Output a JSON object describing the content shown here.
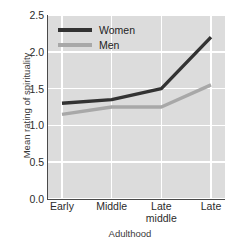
{
  "chart_data": {
    "type": "line",
    "title": "",
    "xlabel": "Adulthood",
    "ylabel": "Mean rating of spirituality",
    "categories": [
      "Early",
      "Middle",
      "Late middle",
      "Late"
    ],
    "category_lines": [
      [
        "Early"
      ],
      [
        "Middle"
      ],
      [
        "Late",
        "middle"
      ],
      [
        "Late"
      ]
    ],
    "ylim": [
      0.0,
      2.5
    ],
    "yticks": [
      "2.5",
      "2.0",
      "1.5",
      "1.0",
      "0.5",
      "0.0"
    ],
    "ytick_values": [
      2.5,
      2.0,
      1.5,
      1.0,
      0.5,
      0.0
    ],
    "grid": true,
    "legend_position": "top-left",
    "series": [
      {
        "name": "Women",
        "color": "#333333",
        "values": [
          1.3,
          1.35,
          1.5,
          2.2
        ]
      },
      {
        "name": "Men",
        "color": "#a8a8a8",
        "values": [
          1.15,
          1.25,
          1.25,
          1.55
        ]
      }
    ]
  },
  "legend": {
    "items": [
      {
        "label": "Women",
        "color": "#333333"
      },
      {
        "label": "Men",
        "color": "#a8a8a8"
      }
    ]
  },
  "style": {
    "panel_background": "#dcdcdc",
    "grid_color": "#ffffff",
    "axis_color": "#4a4a4a",
    "text_color": "#2b2b2b"
  }
}
